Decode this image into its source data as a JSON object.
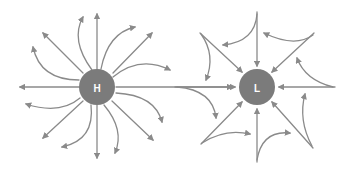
{
  "diagram": {
    "type": "pressure-system-airflow",
    "colors": {
      "arrow": "#8a8a8a",
      "center_fill": "#7b7b7b",
      "label": "#ffffff",
      "background": "#ffffff"
    },
    "high": {
      "label": "H",
      "center": [
        97,
        87
      ],
      "radius": 18,
      "flow": "outward (divergent)",
      "straight_arrows": [
        [
          97,
          69,
          97,
          14
        ],
        [
          113,
          73,
          152,
          33
        ],
        [
          116,
          87,
          232,
          87
        ],
        [
          112,
          101,
          153,
          140
        ],
        [
          97,
          105,
          97,
          158
        ],
        [
          83,
          101,
          43,
          138
        ],
        [
          79,
          87,
          20,
          87
        ],
        [
          83,
          73,
          43,
          33
        ]
      ],
      "curved_arrows": [
        "M92 70 Q70 40 83 17",
        "M101 69 Q108 33 135 27",
        "M113 77 Q140 55 170 70",
        "M116 93 Q155 95 162 122",
        "M104 105 Q125 130 115 153",
        "M91 105 Q95 140 62 147",
        "M80 98 Q60 115 26 104",
        "M79 80 Q40 80 33 47"
      ]
    },
    "low": {
      "label": "L",
      "center": [
        257,
        87
      ],
      "radius": 18,
      "flow": "inward (convergent)",
      "straight_arrows": [
        [
          257,
          12,
          257,
          66
        ],
        [
          314,
          33,
          272,
          72
        ],
        [
          335,
          87,
          279,
          87
        ],
        [
          313,
          148,
          272,
          102
        ],
        [
          257,
          162,
          257,
          109
        ],
        [
          201,
          144,
          242,
          102
        ],
        [
          175,
          87,
          235,
          87
        ],
        [
          200,
          33,
          242,
          72
        ]
      ],
      "curved_arrows": [
        "M257 14 Q255 42 223 45",
        "M313 35 Q295 48 264 33",
        "M333 87 Q305 80 297 58",
        "M312 146 Q298 120 305 94",
        "M257 160 Q262 130 290 133",
        "M202 143 Q225 128 250 134",
        "M177 87 Q213 90 216 118",
        "M201 34 Q216 55 206 80"
      ]
    },
    "connector": {
      "description": "horizontal arrow from H to L",
      "from": "H",
      "to": "L"
    }
  }
}
